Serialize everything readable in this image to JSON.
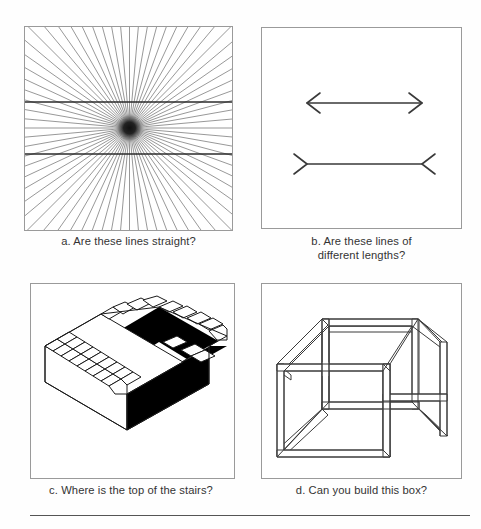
{
  "figure": {
    "panel_count": 4,
    "background_color": "#ffffff",
    "ink_color": "#333333",
    "border_color": "#9a9a9a"
  },
  "panels": [
    {
      "key": "a",
      "letter": "a.",
      "caption": "a. Are these lines straight?",
      "caption_line1": "a. Are these lines straight?",
      "caption_line2": "",
      "illusion_name": "hering-illusion",
      "description": "Radiating fan of lines from a dark central point crossed by two horizontal straight lines",
      "ray_count": 72,
      "horizontal_line_count": 2
    },
    {
      "key": "b",
      "letter": "b.",
      "caption": "b. Are these lines of different lengths?",
      "caption_line1": "b. Are these lines of",
      "caption_line2": "different lengths?",
      "illusion_name": "muller-lyer-illusion",
      "description": "Two equal horizontal shafts, the upper with outward arrowheads, the lower with inward arrow tails",
      "shaft_count": 2
    },
    {
      "key": "c",
      "letter": "c.",
      "caption": "c. Where is the top of the stairs?",
      "caption_line1": "c. Where is the top of the stairs?",
      "caption_line2": "",
      "illusion_name": "penrose-stairs",
      "description": "Impossible staircase drawn as an endlessly ascending block of steps with a black shaded side",
      "step_count": 15
    },
    {
      "key": "d",
      "letter": "d.",
      "caption": "d. Can you build this box?",
      "caption_line1": "d. Can you build this box?",
      "caption_line2": "",
      "illusion_name": "impossible-cube",
      "description": "Impossible cube drawn from square beams where a back edge passes in front of a front edge",
      "beam_count": 12
    }
  ],
  "footer": {
    "rule": "horizontal-rule"
  }
}
